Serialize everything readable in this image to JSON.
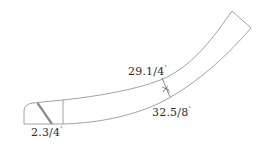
{
  "diagram": {
    "type": "curved-board-outline",
    "stroke_color": "#8a8a8a",
    "stripe_color": "#8c8c8c",
    "text_color": "#2b2b2b",
    "labels": {
      "inner_length": {
        "value": "29.1/4",
        "unit": "\""
      },
      "outer_length": {
        "value": "32.5/8",
        "unit": "\""
      },
      "end_width": {
        "value": "2.3/4",
        "unit": "\""
      }
    }
  }
}
